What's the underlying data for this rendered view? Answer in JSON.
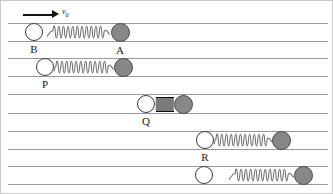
{
  "figure": {
    "kind": "physics-diagram",
    "width": 333,
    "height": 194,
    "colors": {
      "background": "#ffffff",
      "rail_line": "#9a9a9a",
      "border": "#c9c9c9",
      "ball_light_fill": "#ffffff",
      "ball_light_stroke": "#3a3a3a",
      "ball_dark_fill": "#878787",
      "ball_dark_stroke": "#4a4a4a",
      "spring_stroke": "#6d6d6d",
      "spring_compressed": "#0d0d0d",
      "label_text": "#1a1a1a",
      "arrow": "#111111"
    }
  },
  "velocity_arrow": {
    "label": "v",
    "subscript": "0",
    "direction": "right",
    "points_to": "ball-B"
  },
  "rails": [
    {
      "name": "rail-1-top",
      "y": 22,
      "x": 7,
      "width": 320
    },
    {
      "name": "rail-1-bottom",
      "y": 40,
      "x": 7,
      "width": 320
    },
    {
      "name": "rail-2-top",
      "y": 57,
      "x": 7,
      "width": 320
    },
    {
      "name": "rail-2-bottom",
      "y": 75,
      "x": 7,
      "width": 320
    },
    {
      "name": "rail-3-top",
      "y": 93,
      "x": 7,
      "width": 320
    },
    {
      "name": "rail-3-bottom",
      "y": 112,
      "x": 7,
      "width": 320
    },
    {
      "name": "rail-4-top",
      "y": 130,
      "x": 7,
      "width": 320
    },
    {
      "name": "rail-4-bottom",
      "y": 148,
      "x": 7,
      "width": 320
    },
    {
      "name": "rail-5-top",
      "y": 165,
      "x": 7,
      "width": 320
    },
    {
      "name": "rail-5-bottom",
      "y": 183,
      "x": 7,
      "width": 320
    }
  ],
  "frames": [
    {
      "id": "frame-1",
      "caption_note": "Before contact: B approaches A with speed v0, spring relaxed",
      "spring_state": "relaxed",
      "light_ball": {
        "label": "B",
        "cx": 33,
        "cy": 31,
        "r": 9
      },
      "dark_ball": {
        "label": "A",
        "cx": 119,
        "cy": 31,
        "r": 9.5
      },
      "spring": {
        "x": 46,
        "y": 22,
        "width": 63,
        "height": 18,
        "coils": 11
      }
    },
    {
      "id": "frame-2",
      "caption_note": "Contact begins: spring starts to compress",
      "spring_state": "partly-compressed",
      "light_ball": {
        "label": "P",
        "cx": 44,
        "cy": 66,
        "r": 9
      },
      "dark_ball": {
        "label": "",
        "cx": 122,
        "cy": 66,
        "r": 9.5
      },
      "spring": {
        "x": 53,
        "y": 57,
        "width": 60,
        "height": 18,
        "coils": 11
      }
    },
    {
      "id": "frame-3",
      "caption_note": "Maximum compression: both balls move with common velocity",
      "spring_state": "fully-compressed",
      "light_ball": {
        "label": "Q",
        "cx": 145,
        "cy": 103,
        "r": 9
      },
      "dark_ball": {
        "label": "",
        "cx": 182,
        "cy": 103,
        "r": 9.5
      },
      "spring": {
        "x": 155,
        "y": 96,
        "width": 18,
        "height": 15,
        "coils": 18
      }
    },
    {
      "id": "frame-4",
      "caption_note": "Spring expanding: balls pushed apart",
      "spring_state": "partly-compressed",
      "light_ball": {
        "label": "R",
        "cx": 204,
        "cy": 139,
        "r": 9
      },
      "dark_ball": {
        "label": "",
        "cx": 280,
        "cy": 139,
        "r": 9.5
      },
      "spring": {
        "x": 213,
        "y": 130,
        "width": 59,
        "height": 18,
        "coils": 11
      }
    },
    {
      "id": "frame-5",
      "caption_note": "After separation: spring relaxed again, balls separated",
      "spring_state": "relaxed",
      "light_ball": {
        "label": "",
        "cx": 203,
        "cy": 174,
        "r": 9
      },
      "dark_ball": {
        "label": "",
        "cx": 302,
        "cy": 174,
        "r": 9.5
      },
      "spring": {
        "x": 228,
        "y": 165,
        "width": 65,
        "height": 18,
        "coils": 11
      }
    }
  ]
}
